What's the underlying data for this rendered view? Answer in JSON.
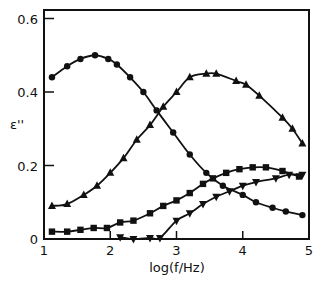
{
  "chart_data": {
    "type": "line",
    "title": "",
    "xlabel": "log(f/Hz)",
    "ylabel": "ε''",
    "xlim": [
      1,
      5
    ],
    "ylim": [
      0,
      0.62
    ],
    "xticks": [
      1,
      2,
      3,
      4,
      5
    ],
    "xtick_labels": [
      "1",
      "2",
      "3",
      "4",
      "5"
    ],
    "yticks": [
      0,
      0.2,
      0.4,
      0.6
    ],
    "ytick_labels": [
      "0",
      "0.2",
      "0.4",
      "0.6"
    ],
    "grid": false,
    "legend": null,
    "series": [
      {
        "name": "circles",
        "marker": "circle",
        "x": [
          1.12,
          1.35,
          1.55,
          1.77,
          1.97,
          2.1,
          2.3,
          2.5,
          2.7,
          2.95,
          3.2,
          3.45,
          3.7,
          4.0,
          4.2,
          4.45,
          4.65,
          4.9
        ],
        "y": [
          0.44,
          0.47,
          0.49,
          0.5,
          0.49,
          0.475,
          0.44,
          0.4,
          0.35,
          0.29,
          0.23,
          0.18,
          0.145,
          0.12,
          0.1,
          0.085,
          0.075,
          0.065
        ]
      },
      {
        "name": "up-triangles",
        "marker": "triangle-up",
        "x": [
          1.12,
          1.35,
          1.6,
          1.8,
          2.0,
          2.2,
          2.4,
          2.6,
          2.8,
          3.0,
          3.2,
          3.45,
          3.6,
          3.9,
          4.05,
          4.25,
          4.6,
          4.75,
          4.9
        ],
        "y": [
          0.09,
          0.095,
          0.12,
          0.145,
          0.18,
          0.22,
          0.27,
          0.31,
          0.36,
          0.4,
          0.44,
          0.45,
          0.45,
          0.43,
          0.42,
          0.39,
          0.33,
          0.3,
          0.26
        ]
      },
      {
        "name": "squares",
        "marker": "square",
        "x": [
          1.12,
          1.35,
          1.55,
          1.75,
          1.95,
          2.15,
          2.35,
          2.6,
          2.8,
          3.0,
          3.2,
          3.4,
          3.55,
          3.75,
          3.95,
          4.15,
          4.35,
          4.6,
          4.85
        ],
        "y": [
          0.02,
          0.02,
          0.025,
          0.03,
          0.03,
          0.045,
          0.05,
          0.07,
          0.09,
          0.105,
          0.125,
          0.15,
          0.165,
          0.18,
          0.19,
          0.195,
          0.195,
          0.185,
          0.17
        ]
      },
      {
        "name": "down-triangles",
        "marker": "triangle-down",
        "x": [
          2.15,
          2.35,
          2.6,
          2.75,
          3.0,
          3.2,
          3.4,
          3.6,
          3.8,
          4.0,
          4.2,
          4.5,
          4.7,
          4.9
        ],
        "y": [
          0.005,
          0.0,
          0.003,
          0.003,
          0.05,
          0.07,
          0.095,
          0.115,
          0.13,
          0.145,
          0.155,
          0.165,
          0.175,
          0.175
        ]
      }
    ]
  },
  "colors": {
    "ink": "#111111",
    "background": "#ffffff"
  }
}
